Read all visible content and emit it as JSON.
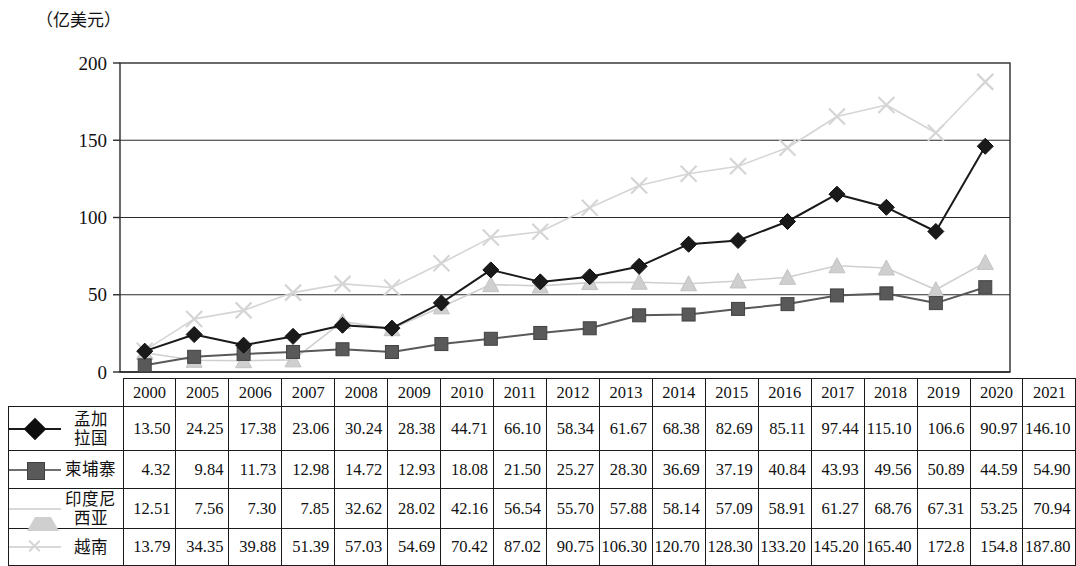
{
  "unit_label": "（亿美元）",
  "year_axis_label": "(年份)",
  "chart_data": {
    "type": "line",
    "title": "",
    "xlabel": "(年份)",
    "ylabel": "（亿美元）",
    "ylim": [
      0,
      200
    ],
    "yticks": [
      0,
      50,
      100,
      150,
      200
    ],
    "grid": true,
    "legend_position": "table-left",
    "categories": [
      "2000",
      "2005",
      "2006",
      "2007",
      "2008",
      "2009",
      "2010",
      "2011",
      "2012",
      "2013",
      "2014",
      "2015",
      "2016",
      "2017",
      "2018",
      "2019",
      "2020",
      "2021"
    ],
    "series": [
      {
        "name": "孟加拉国",
        "marker": "diamond",
        "color": "#1a1a1a",
        "values": [
          13.5,
          24.25,
          17.38,
          23.06,
          30.24,
          28.38,
          44.71,
          66.1,
          58.34,
          61.67,
          68.38,
          82.69,
          85.11,
          97.44,
          115.1,
          106.6,
          90.97,
          146.1
        ],
        "labels": [
          "13.50",
          "24.25",
          "17.38",
          "23.06",
          "30.24",
          "28.38",
          "44.71",
          "66.10",
          "58.34",
          "61.67",
          "68.38",
          "82.69",
          "85.11",
          "97.44",
          "115.10",
          "106.6",
          "90.97",
          "146.10"
        ]
      },
      {
        "name": "柬埔寨",
        "marker": "square",
        "color": "#595959",
        "values": [
          4.32,
          9.84,
          11.73,
          12.98,
          14.72,
          12.93,
          18.08,
          21.5,
          25.27,
          28.3,
          36.69,
          37.19,
          40.84,
          43.93,
          49.56,
          50.89,
          44.59,
          54.9
        ],
        "labels": [
          "4.32",
          "9.84",
          "11.73",
          "12.98",
          "14.72",
          "12.93",
          "18.08",
          "21.50",
          "25.27",
          "28.30",
          "36.69",
          "37.19",
          "40.84",
          "43.93",
          "49.56",
          "50.89",
          "44.59",
          "54.90"
        ]
      },
      {
        "name": "印度尼西亚",
        "marker": "triangle",
        "color": "#cfcfcf",
        "values": [
          12.51,
          7.56,
          7.3,
          7.85,
          32.62,
          28.02,
          42.16,
          56.54,
          55.7,
          57.88,
          58.14,
          57.09,
          58.91,
          61.27,
          68.76,
          67.31,
          53.25,
          70.94
        ],
        "labels": [
          "12.51",
          "7.56",
          "7.30",
          "7.85",
          "32.62",
          "28.02",
          "42.16",
          "56.54",
          "55.70",
          "57.88",
          "58.14",
          "57.09",
          "58.91",
          "61.27",
          "68.76",
          "67.31",
          "53.25",
          "70.94"
        ]
      },
      {
        "name": "越南",
        "marker": "x",
        "color": "#d5d5d5",
        "values": [
          13.79,
          34.35,
          39.88,
          51.39,
          57.03,
          54.69,
          70.42,
          87.02,
          90.75,
          106.3,
          120.7,
          128.3,
          133.2,
          145.2,
          165.4,
          172.8,
          154.8,
          187.8
        ],
        "labels": [
          "13.79",
          "34.35",
          "39.88",
          "51.39",
          "57.03",
          "54.69",
          "70.42",
          "87.02",
          "90.75",
          "106.30",
          "120.70",
          "128.30",
          "133.20",
          "145.20",
          "165.40",
          "172.8",
          "154.8",
          "187.80"
        ]
      }
    ]
  }
}
